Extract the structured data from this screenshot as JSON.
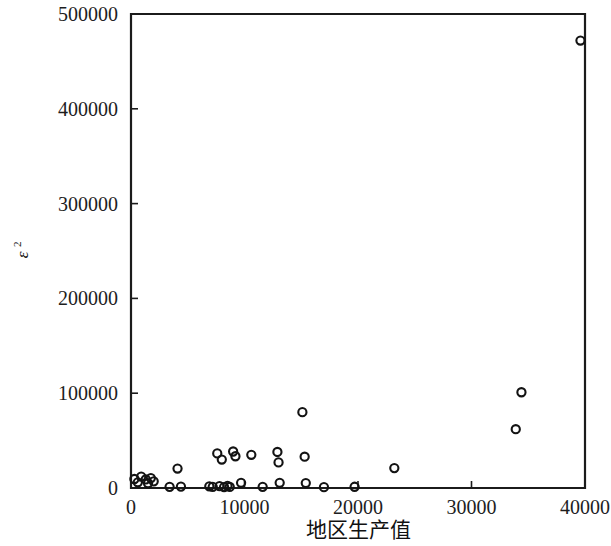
{
  "chart_data": {
    "type": "scatter",
    "title": "",
    "subtitle": "",
    "xlabel": "地区生产值",
    "ylabel": "ε",
    "ylabel_superscript": "2",
    "xlim": [
      0,
      40000
    ],
    "ylim": [
      0,
      500000
    ],
    "xticks": [
      0,
      10000,
      20000,
      30000,
      40000
    ],
    "xtick_labels": [
      "0",
      "10000",
      "20000",
      "30000",
      "40000"
    ],
    "yticks": [
      0,
      100000,
      200000,
      300000,
      400000,
      500000
    ],
    "ytick_labels": [
      "0",
      "100000",
      "200000",
      "300000",
      "400000",
      "500000"
    ],
    "grid": false,
    "legend": null,
    "marker": "open-circle",
    "marker_color": "#131313",
    "points": [
      {
        "x": 300,
        "y": 9500
      },
      {
        "x": 600,
        "y": 6000
      },
      {
        "x": 900,
        "y": 12000
      },
      {
        "x": 1300,
        "y": 9000
      },
      {
        "x": 1500,
        "y": 5000
      },
      {
        "x": 1750,
        "y": 10500
      },
      {
        "x": 2000,
        "y": 7000
      },
      {
        "x": 3400,
        "y": 1200
      },
      {
        "x": 4100,
        "y": 20500
      },
      {
        "x": 4400,
        "y": 1500
      },
      {
        "x": 6900,
        "y": 1800
      },
      {
        "x": 7200,
        "y": 1200
      },
      {
        "x": 7600,
        "y": 36500
      },
      {
        "x": 7800,
        "y": 2000
      },
      {
        "x": 8000,
        "y": 30000
      },
      {
        "x": 8200,
        "y": 1000
      },
      {
        "x": 8500,
        "y": 2200
      },
      {
        "x": 8700,
        "y": 1100
      },
      {
        "x": 9000,
        "y": 38500
      },
      {
        "x": 9200,
        "y": 33500
      },
      {
        "x": 9700,
        "y": 5500
      },
      {
        "x": 10600,
        "y": 35000
      },
      {
        "x": 11600,
        "y": 1200
      },
      {
        "x": 12900,
        "y": 38000
      },
      {
        "x": 13000,
        "y": 27000
      },
      {
        "x": 13100,
        "y": 5500
      },
      {
        "x": 15100,
        "y": 80000
      },
      {
        "x": 15300,
        "y": 33000
      },
      {
        "x": 15400,
        "y": 5200
      },
      {
        "x": 17000,
        "y": 900
      },
      {
        "x": 19700,
        "y": 1300
      },
      {
        "x": 23200,
        "y": 21000
      },
      {
        "x": 33900,
        "y": 62000
      },
      {
        "x": 34400,
        "y": 101000
      },
      {
        "x": 39600,
        "y": 472000
      }
    ]
  },
  "figure": {
    "background": "#ffffff",
    "axis_color": "#1b1b1b"
  }
}
